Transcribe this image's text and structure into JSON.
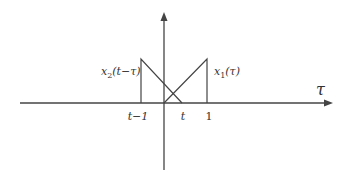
{
  "diagram": {
    "axis": {
      "horizontal_label": "τ",
      "color": "#444444"
    },
    "curves": [
      {
        "name": "x1",
        "label_main": "x",
        "label_sub": "1",
        "label_arg": "(τ)",
        "description": "ramp from 0 up to 1"
      },
      {
        "name": "x2",
        "label_main": "x",
        "label_sub": "2",
        "label_arg": "(t−τ)",
        "description": "ramp from t−1 down to t"
      }
    ],
    "ticks": [
      {
        "label": "t−1"
      },
      {
        "label": "t"
      },
      {
        "label": "1"
      }
    ]
  }
}
